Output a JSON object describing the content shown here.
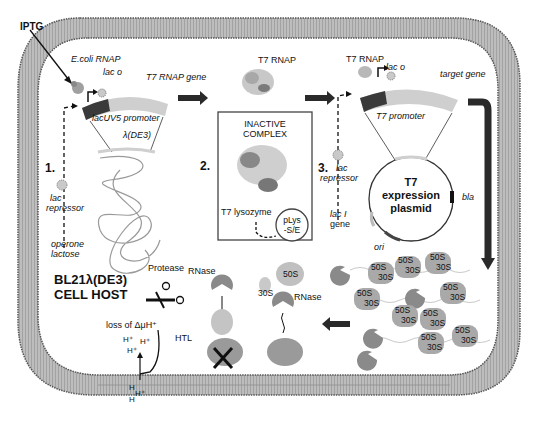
{
  "diagram": {
    "colors": {
      "membrane_fill": "#b4b4b4",
      "membrane_edge": "#5a5a5a",
      "cytoplasm": "#ffffff",
      "promoter_dark": "#3a3a3a",
      "gene_light": "#cfcfcf",
      "ribosome": "#a9a9a9",
      "rnase": "#8a8a8a",
      "arrow": "#2a2a2a"
    },
    "labels": {
      "iptg": "IPTG",
      "ecoli_rnap": "E.coli RNAP",
      "lac_o_1": "lac o",
      "t7_rnap_gene": "T7 RNAP gene",
      "lacuv5_promoter": "lacUV5 promoter",
      "lambda_de3": "λ(DE3)",
      "step1": "1.",
      "lac_repressor_1_line1": "lac",
      "lac_repressor_1_line2": "repressor",
      "operone_line1": "operone",
      "operone_line2": "lactose",
      "t7_rnap_mid": "T7 RNAP",
      "inactive_line1": "INACTIVE",
      "inactive_line2": "COMPLEX",
      "step2": "2.",
      "t7_lysozyme": "T7 lysozyme",
      "plys_line1": "pLys",
      "plys_line2": "-S/E",
      "t7_rnap_right": "T7 RNAP",
      "lac_o_2": "lac o",
      "target_gene": "target gene",
      "t7_promoter": "T7 promoter",
      "step3": "3.",
      "lac_repressor_3_line1": "lac",
      "lac_repressor_3_line2": "repressor",
      "laci_line1": "lac I",
      "laci_line2": "gene",
      "plasmid_line1": "T7",
      "plasmid_line2": "expression",
      "plasmid_line3": "plasmid",
      "bla": "bla",
      "ori": "ori",
      "host_line1": "BL21λ(DE3)",
      "host_line2": "CELL HOST",
      "protease": "Protease",
      "rnase_1": "RNase",
      "rnase_2": "RNase",
      "htl": "HTL",
      "loss_pmf": "loss of ΔμH⁺",
      "h_plus": "H⁺",
      "free_50s": "50S",
      "free_30s": "30S",
      "h_membrane": "H"
    },
    "ribosomes": [
      {
        "large": "50S",
        "small": "30S"
      },
      {
        "large": "50S",
        "small": "30S"
      },
      {
        "large": "50S",
        "small": "30S"
      },
      {
        "large": "50S",
        "small": "30S"
      },
      {
        "large": "50S",
        "small": "30S"
      },
      {
        "large": "50S",
        "small": "30S"
      },
      {
        "large": "50S",
        "small": "30S"
      },
      {
        "large": "50S",
        "small": "30S"
      },
      {
        "large": "50S",
        "small": "30S"
      }
    ]
  }
}
